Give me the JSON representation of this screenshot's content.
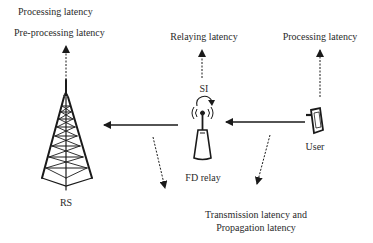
{
  "diagram": {
    "type": "network-latency-diagram",
    "nodes": {
      "rs": {
        "label": "RS",
        "icon": "transmission-tower-icon",
        "annotations": [
          "Processing latency",
          "Pre-processing latency"
        ]
      },
      "relay": {
        "label": "FD relay",
        "icon": "antenna-relay-icon",
        "self_interference_label": "SI",
        "annotation": "Relaying latency"
      },
      "user": {
        "label": "User",
        "icon": "mobile-device-icon",
        "annotation": "Processing latency"
      }
    },
    "links": [
      {
        "from": "User",
        "to": "FD relay",
        "style": "solid-arrow"
      },
      {
        "from": "FD relay",
        "to": "RS",
        "style": "solid-arrow"
      }
    ],
    "link_annotation": {
      "line1": "Transmission latency and",
      "line2": "Propagation latency"
    },
    "colors": {
      "stroke": "#1a1a1a",
      "text": "#2a2a2a",
      "background": "#ffffff"
    }
  }
}
